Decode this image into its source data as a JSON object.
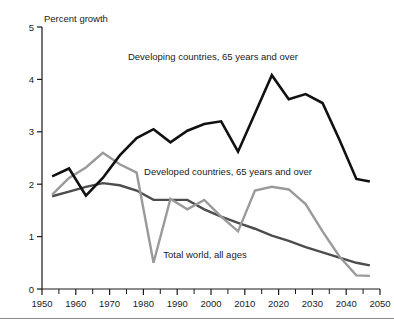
{
  "chart_data": {
    "type": "line",
    "title": "",
    "subtitle": "",
    "xlabel": "",
    "ylabel": "Percent growth",
    "xlim": [
      1950,
      2050
    ],
    "ylim": [
      0,
      5
    ],
    "ytick_labels": [
      "0",
      "1",
      "2",
      "3",
      "4",
      "5"
    ],
    "ytick_values": [
      0,
      1,
      2,
      3,
      4,
      5
    ],
    "xtick_labels": [
      "1950",
      "1960",
      "1970",
      "1980",
      "1990",
      "2000",
      "2010",
      "2020",
      "2030",
      "2040",
      "2050"
    ],
    "xtick_values": [
      1950,
      1960,
      1970,
      1980,
      1990,
      2000,
      2010,
      2020,
      2030,
      2040,
      2050
    ],
    "xminor_step": 5,
    "grid": false,
    "legend_position": "inline-annotations",
    "series": [
      {
        "name": "Developing countries, 65 years and over",
        "color": "#111111",
        "width": 2.6,
        "x": [
          1953,
          1958,
          1963,
          1968,
          1973,
          1978,
          1983,
          1988,
          1993,
          1998,
          2003,
          2008,
          2013,
          2018,
          2023,
          2028,
          2033,
          2038,
          2043,
          2047
        ],
        "y": [
          2.15,
          2.3,
          1.78,
          2.12,
          2.55,
          2.88,
          3.05,
          2.8,
          3.02,
          3.15,
          3.2,
          2.62,
          3.35,
          4.08,
          3.62,
          3.72,
          3.55,
          2.85,
          2.1,
          2.05
        ]
      },
      {
        "name": "Developed countries, 65 years and over",
        "color": "#9a9a9a",
        "width": 2.4,
        "x": [
          1953,
          1958,
          1963,
          1968,
          1973,
          1978,
          1983,
          1988,
          1993,
          1998,
          2003,
          2008,
          2013,
          2018,
          2023,
          2028,
          2033,
          2038,
          2043,
          2047
        ],
        "y": [
          1.8,
          2.12,
          2.32,
          2.6,
          2.38,
          2.22,
          0.5,
          1.72,
          1.52,
          1.7,
          1.38,
          1.1,
          1.88,
          1.95,
          1.9,
          1.62,
          1.1,
          0.62,
          0.26,
          0.25
        ]
      },
      {
        "name": "Total world, all ages",
        "color": "#4d4d4d",
        "width": 2.4,
        "x": [
          1953,
          1958,
          1963,
          1968,
          1973,
          1978,
          1983,
          1988,
          1993,
          1998,
          2003,
          2008,
          2013,
          2018,
          2023,
          2028,
          2033,
          2038,
          2043,
          2047
        ],
        "y": [
          1.77,
          1.86,
          1.95,
          2.02,
          1.98,
          1.88,
          1.7,
          1.7,
          1.7,
          1.52,
          1.38,
          1.26,
          1.15,
          1.02,
          0.92,
          0.8,
          0.7,
          0.6,
          0.5,
          0.45
        ]
      }
    ],
    "annotations": [
      {
        "text": "Developing countries, 65 years and over",
        "x_px": 213,
        "y_px": 60,
        "anchor": "middle"
      },
      {
        "text": "Developed countries, 65 years and over",
        "x_px": 228,
        "y_px": 175,
        "anchor": "middle"
      },
      {
        "text": "Total world, all ages",
        "x_px": 205,
        "y_px": 258,
        "anchor": "middle"
      }
    ]
  }
}
